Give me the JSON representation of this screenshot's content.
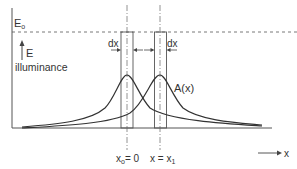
{
  "diagram": {
    "labels": {
      "e0": "E",
      "e0_sub": "o",
      "e_arrow": "E",
      "illuminance": "illuminance",
      "dx_left": "dx",
      "dx_right": "dx",
      "a_of_x": "A(x)",
      "x_axis": "x",
      "x0_label_main": "x",
      "x0_label_sub": "o",
      "x0_label_eq": "= 0",
      "x1_label_main": "x = x",
      "x1_label_sub": "1"
    },
    "colors": {
      "line": "#333333",
      "guide": "#777777",
      "background": "#ffffff"
    },
    "positions": {
      "x0": 127,
      "x1": 160,
      "peak_y": 75,
      "baseline_y": 128,
      "e0_y": 32
    }
  }
}
